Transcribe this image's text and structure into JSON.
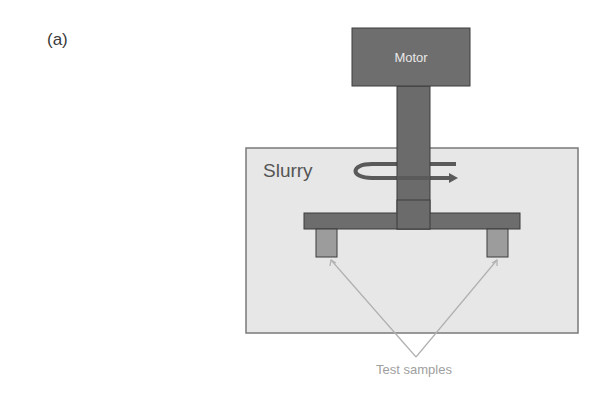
{
  "figure": {
    "panel_label": "(a)",
    "motor_label": "Motor",
    "slurry_label": "Slurry",
    "samples_label": "Test samples"
  },
  "colors": {
    "motor_fill": "#6e6e6e",
    "shaft_fill": "#6b6b6b",
    "crossbar_fill": "#6d6d6d",
    "sample_fill": "#9c9c9c",
    "slurry_fill": "#e7e7e7",
    "slurry_border": "#7a7a7a",
    "outline": "#3c3c3c",
    "callout_line": "#b0b0b0",
    "callout_text": "#a0a0a0",
    "motor_text": "#e8e8e8",
    "slurry_text": "#555555"
  }
}
